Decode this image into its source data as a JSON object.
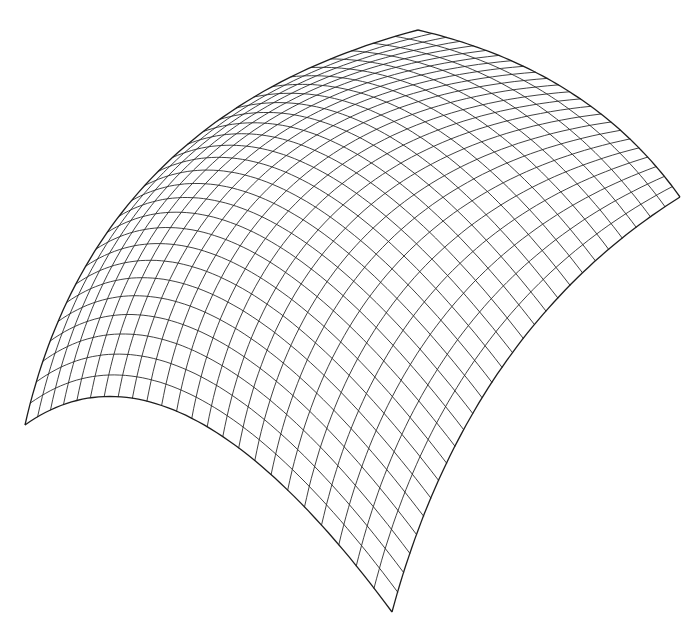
{
  "figure": {
    "type": "wireframe-surface",
    "background_color": "#ffffff",
    "line_color": "#2a2a2a",
    "grid": {
      "u_divisions": 24,
      "v_divisions": 28
    },
    "corners": {
      "left": [
        25,
        425
      ],
      "bottom": [
        392,
        612
      ],
      "right": [
        680,
        197
      ],
      "top": [
        418,
        30
      ]
    },
    "edge_controls": {
      "front_left": [
        175,
        318
      ],
      "front_right": [
        468,
        330
      ],
      "back_right": [
        590,
        70
      ],
      "back_left": [
        95,
        115
      ]
    },
    "interior_bulge": [
      -18,
      -22
    ]
  }
}
